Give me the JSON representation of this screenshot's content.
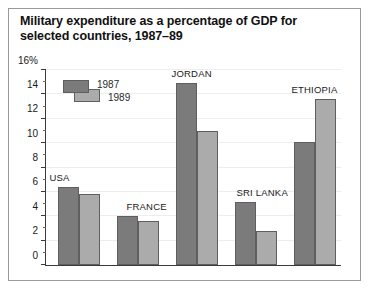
{
  "figure": {
    "title": "Military expenditure as a percentage of GDP for selected countries, 1987–89",
    "background_color": "#ffffff",
    "frame_color": "#9a9a9a"
  },
  "legend": {
    "position": "inside-top-left",
    "entries": [
      {
        "label": "1987",
        "color": "#7b7b7b"
      },
      {
        "label": "1989",
        "color": "#ababab"
      }
    ]
  },
  "chart_data": {
    "type": "bar",
    "title": "Military expenditure as a percentage of GDP for selected countries, 1987–89",
    "xlabel": "",
    "ylabel": "",
    "categories": [
      "USA",
      "FRANCE",
      "JORDAN",
      "SRI LANKA",
      "ETHIOPIA"
    ],
    "series": [
      {
        "name": "1987",
        "color": "#7b7b7b",
        "values": [
          6.4,
          4.0,
          14.9,
          5.2,
          10.1
        ]
      },
      {
        "name": "1989",
        "color": "#ababab",
        "values": [
          5.8,
          3.6,
          11.0,
          2.8,
          13.6
        ]
      }
    ],
    "ylim": [
      0,
      16
    ],
    "yticks": [
      0,
      2,
      4,
      6,
      8,
      10,
      12,
      14,
      16
    ],
    "ytick_labels": [
      "0",
      "2",
      "4",
      "6",
      "8",
      "10",
      "12",
      "14",
      "16%"
    ],
    "yminor_ticks": [
      1,
      3,
      5,
      7,
      9,
      11,
      13,
      15
    ],
    "grid": true,
    "legend_entries": [
      "1987",
      "1989"
    ]
  }
}
